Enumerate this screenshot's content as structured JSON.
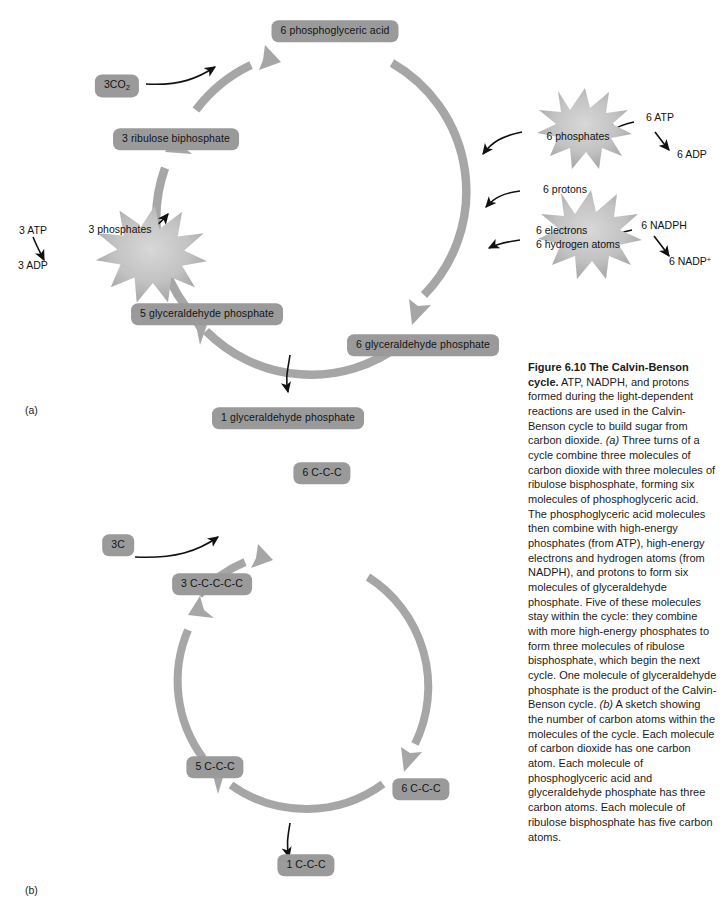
{
  "figure": {
    "number": "Figure 6.10",
    "title_line1": "Figure 6.10  The Calvin-Benson",
    "title_line2": "cycle.",
    "caption_body": " ATP, NADPH, and protons formed during the light-dependent reactions are used in the Calvin-Benson cycle to build sugar from carbon dioxide. ",
    "caption_a_marker": "(a)",
    "caption_part_a": " Three turns of a cycle combine three molecules of carbon dioxide with three molecules of ribulose bisphosphate, forming six molecules of phosphoglyceric acid. The phosphoglyceric acid molecules then combine with high-energy phosphates (from ATP), high-energy electrons and hydrogen atoms (from NADPH), and protons to form six molecules of glyceraldehyde phosphate. Five of these molecules stay within the cycle: they combine with more high-energy phosphates to form three molecules of ribulose bisphosphate, which begin the next cycle. One molecule of glyceraldehyde phosphate is the product of the Calvin-Benson cycle. ",
    "caption_b_marker": "(b)",
    "caption_part_b": " A sketch showing the number of carbon atoms within the molecules of the cycle. Each molecule of carbon dioxide has one carbon atom. Each molecule of phosphoglyceric acid and glyceraldehyde phosphate has three carbon atoms. Each molecule of ribulose bisphosphate has five carbon atoms."
  },
  "panel_a": {
    "letter": "(a)",
    "nodes": {
      "phosphoglyceric_acid": "6 phosphoglyceric acid",
      "ribulose_biphosphate": "3 ribulose  biphosphate",
      "carbon_dioxide": "3CO2",
      "carbon_dioxide_base": "3CO",
      "carbon_dioxide_sub": "2",
      "glyceraldehyde_5": "5 glyceraldehyde phosphate",
      "glyceraldehyde_6": "6 glyceraldehyde phosphate",
      "glyceraldehyde_1": "1 glyceraldehyde phosphate"
    },
    "bursts": {
      "phosphates_3": "3 phosphates",
      "phosphates_6": "6 phosphates",
      "electrons_line1": "6 electrons",
      "electrons_line2": "6 hydrogen atoms"
    },
    "notes": {
      "atp_3": "3 ATP",
      "adp_3": "3 ADP",
      "atp_6": "6 ATP",
      "adp_6": "6 ADP",
      "protons_6": "6 protons",
      "nadph_6": "6 NADPH",
      "nadp_6_base": "6 NADP",
      "nadp_6_sup": "+"
    }
  },
  "panel_b": {
    "letter": "(b)",
    "nodes": {
      "pga_top": "6 C-C-C",
      "rubp_left": "3 C-C-C-C-C",
      "co2_in": "3C",
      "gap_5": "5 C-C-C",
      "gap_6": "6 C-C-C",
      "gap_1": "1 C-C-C"
    }
  },
  "colors": {
    "chip_fill": "#9a9a9a",
    "ring_arrow": "#a0a0a0",
    "burst_fill": "#b5b5b5",
    "text": "#141414",
    "background": "#ffffff"
  }
}
